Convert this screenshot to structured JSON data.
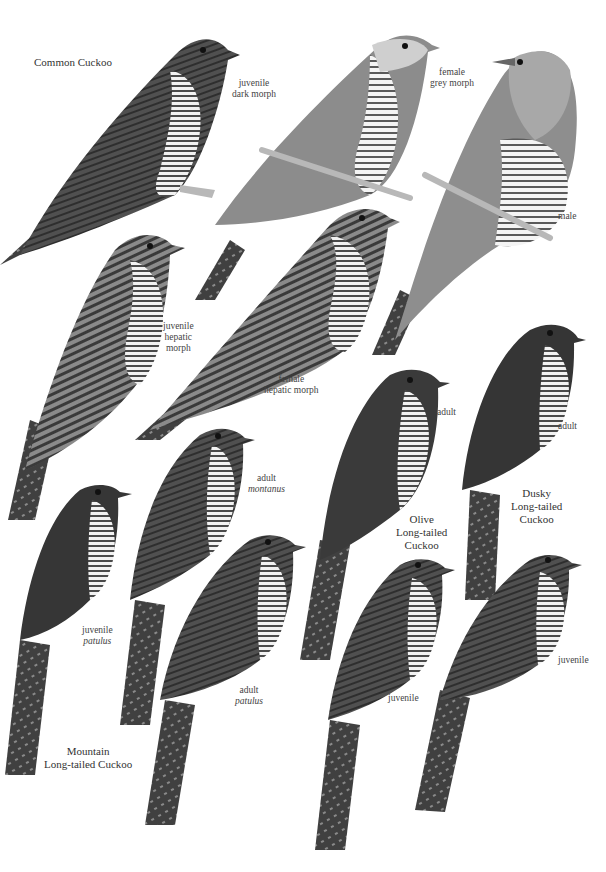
{
  "plate": {
    "background": "#ffffff",
    "species": [
      {
        "name": "Common Cuckoo",
        "figures": [
          {
            "label": [
              "juvenile",
              "dark morph"
            ]
          },
          {
            "label": [
              "female",
              "grey morph"
            ]
          },
          {
            "label": [
              "male"
            ]
          },
          {
            "label": [
              "juvenile",
              "hepatic",
              "morph"
            ]
          },
          {
            "label": [
              "female",
              "hepatic morph"
            ]
          }
        ]
      },
      {
        "name": "Olive Long-tailed Cuckoo",
        "name_lines": [
          "Olive",
          "Long-tailed",
          "Cuckoo"
        ],
        "figures": [
          {
            "label": [
              "adult"
            ]
          },
          {
            "label": [
              "juvenile"
            ]
          }
        ]
      },
      {
        "name": "Dusky Long-tailed Cuckoo",
        "name_lines": [
          "Dusky",
          "Long-tailed",
          "Cuckoo"
        ],
        "figures": [
          {
            "label": [
              "adult"
            ]
          },
          {
            "label": [
              "juvenile"
            ]
          }
        ]
      },
      {
        "name": "Mountain Long-tailed Cuckoo",
        "name_lines": [
          "Mountain",
          "Long-tailed Cuckoo"
        ],
        "figures": [
          {
            "label": [
              "adult"
            ],
            "subspecies": "montanus"
          },
          {
            "label": [
              "juvenile"
            ],
            "subspecies": "patulus"
          },
          {
            "label": [
              "adult"
            ],
            "subspecies": "patulus"
          }
        ]
      }
    ]
  },
  "colors": {
    "dark_plumage": "#3e3e3e",
    "mid_plumage": "#6a6a6a",
    "grey_plumage": "#9a9a9a",
    "pale_plumage": "#d4d4d4",
    "branch": "#b8b8b8",
    "text": "#3a3a3a"
  }
}
